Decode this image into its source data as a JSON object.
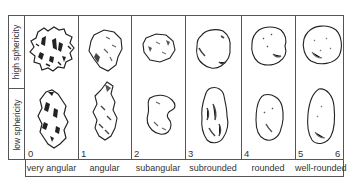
{
  "figure": {
    "row_labels": [
      "high sphericity",
      "low sphericity"
    ],
    "columns": [
      {
        "index": 0,
        "number": "0",
        "label": "very angular"
      },
      {
        "index": 1,
        "number": "1",
        "label": "angular"
      },
      {
        "index": 2,
        "number": "2",
        "label": "subangular"
      },
      {
        "index": 3,
        "number": "3",
        "label": "subrounded"
      },
      {
        "index": 4,
        "number": "4",
        "label": "rounded"
      },
      {
        "index": 5,
        "number": "5",
        "label": "well-rounded"
      }
    ],
    "end_number": "6",
    "grains": {
      "high_sphericity": [
        "very angular equant grain",
        "angular equant grain",
        "subangular equant grain",
        "subrounded equant grain",
        "rounded equant grain",
        "well-rounded equant grain"
      ],
      "low_sphericity": [
        "very angular elongate grain",
        "angular elongate grain",
        "subangular elongate grain",
        "subrounded elongate grain",
        "rounded elongate grain",
        "well-rounded elongate grain"
      ]
    },
    "colors": {
      "line": "#555555",
      "ink": "#222222",
      "shade": "#777777"
    }
  }
}
